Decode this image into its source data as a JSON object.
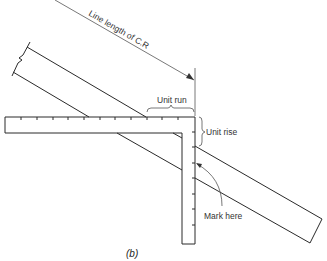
{
  "figure": {
    "caption": "(b)",
    "labels": {
      "line_length": "Line length of C.R",
      "unit_run": "Unit run",
      "unit_rise": "Unit rise",
      "mark_here": "Mark here"
    },
    "colors": {
      "line": "#2a2a2a",
      "background": "#ffffff"
    },
    "square": {
      "blade_ticks": 11,
      "tongue_ticks": 7
    }
  }
}
